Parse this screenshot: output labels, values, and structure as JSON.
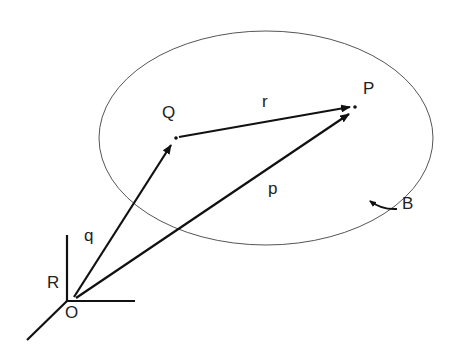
{
  "diagram": {
    "labels": {
      "Q": "Q",
      "P": "P",
      "r": "r",
      "p": "p",
      "q": "q",
      "B": "B",
      "R": "R",
      "O": "O"
    },
    "elements": [
      "region boundary (ellipse)",
      "vector q from O to Q",
      "vector p from O to P",
      "vector r from Q to P",
      "reference frame R at origin O",
      "curved arrow on boundary B"
    ],
    "colors": {
      "stroke": "#111111",
      "boundary": "#555555"
    }
  }
}
